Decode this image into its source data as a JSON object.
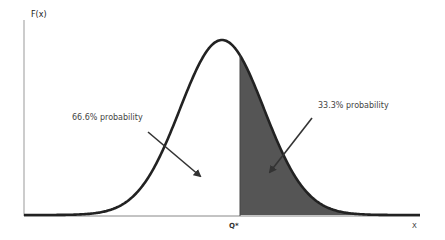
{
  "chart_data": {
    "type": "area",
    "title": "",
    "xlabel": "X",
    "ylabel": "F(x)",
    "distribution": "normal",
    "critical_value_label": "Q*",
    "regions": [
      {
        "name": "left",
        "label": "66.6% probability",
        "probability": 66.6,
        "fill": "#ffffff"
      },
      {
        "name": "right",
        "label": "33.3% probability",
        "probability": 33.3,
        "fill": "#555555"
      }
    ],
    "grid": false,
    "legend": "none",
    "annotations": [
      {
        "text": "66.6% probability",
        "points_to": "left-region"
      },
      {
        "text": "33.3% probability",
        "points_to": "right-shaded-region"
      }
    ]
  },
  "labels": {
    "ylabel": "F(x)",
    "xlabel": "X",
    "qstar": "Q*",
    "left_annotation": "66.6% probability",
    "right_annotation": "33.3% probability"
  },
  "colors": {
    "curve": "#222222",
    "shade": "#555555",
    "axis": "#888888",
    "arrow": "#333333"
  }
}
